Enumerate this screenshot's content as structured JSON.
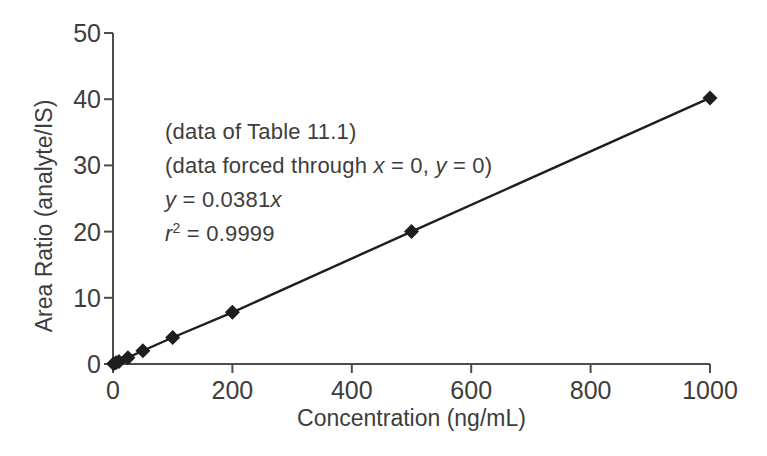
{
  "chart_data": {
    "type": "line",
    "title": "",
    "xlabel": "Concentration (ng/mL)",
    "ylabel": "Area Ratio (analyte/IS)",
    "xlim": [
      0,
      1000
    ],
    "ylim": [
      0,
      50
    ],
    "x_ticks": [
      0,
      200,
      400,
      600,
      800,
      1000
    ],
    "y_ticks": [
      0,
      10,
      20,
      30,
      40,
      50
    ],
    "grid": false,
    "legend": "none",
    "series": [
      {
        "name": "calibration-curve",
        "marker": "diamond",
        "line_through_origin": true,
        "x": [
          1,
          5,
          10,
          25,
          50,
          100,
          200,
          500,
          1000
        ],
        "y": [
          0.04,
          0.19,
          0.38,
          0.95,
          2.0,
          4.0,
          7.8,
          20.0,
          40.2
        ]
      }
    ],
    "fit": {
      "equation": "y = 0.0381x",
      "r_squared": "0.9999",
      "forced_through": "x = 0, y = 0"
    }
  },
  "annotations": {
    "line1": "(data of Table 11.1)",
    "line2_prefix": "(data forced through ",
    "line2_xvar": "x",
    "line2_mid": " = 0, ",
    "line2_yvar": "y",
    "line2_suffix": " = 0)",
    "line3_yvar": "y",
    "line3_eq": " = 0.0381",
    "line3_xvar": "x",
    "line4_rvar": "r",
    "line4_sup": "2",
    "line4_eq": " = 0.9999"
  },
  "colors": {
    "background": "#ffffff",
    "axis": "#4d4d4d",
    "text": "#3d3d3d",
    "series": "#1e1e1e"
  }
}
